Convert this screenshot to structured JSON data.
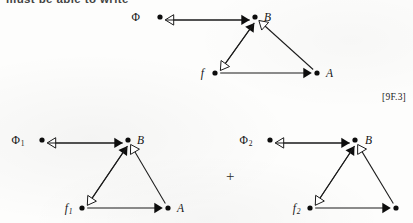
{
  "page": {
    "top_text": "must be able to write",
    "equation_tag": "[9F.3]",
    "operator": "+"
  },
  "diagrams": [
    {
      "id": "top",
      "nodes": [
        {
          "name": "phi",
          "label": "Φ",
          "sub": "",
          "italic": false
        },
        {
          "name": "b",
          "label": "B",
          "sub": "",
          "italic": true
        },
        {
          "name": "f",
          "label": "f",
          "sub": "",
          "italic": true
        },
        {
          "name": "a",
          "label": "A",
          "sub": "",
          "italic": true
        }
      ],
      "edges": [
        {
          "from": "b",
          "to": "phi",
          "head": "hollow"
        },
        {
          "from": "phi",
          "to": "b",
          "head": "solid"
        },
        {
          "from": "f",
          "to": "b",
          "head": "solid"
        },
        {
          "from": "b",
          "to": "f",
          "head": "hollow"
        },
        {
          "from": "a",
          "to": "b",
          "head": "hollow"
        },
        {
          "from": "f",
          "to": "a",
          "head": "solid"
        }
      ]
    },
    {
      "id": "bottom-left",
      "nodes": [
        {
          "name": "phi",
          "label": "Φ",
          "sub": "1",
          "italic": false
        },
        {
          "name": "b",
          "label": "B",
          "sub": "",
          "italic": true
        },
        {
          "name": "f",
          "label": "f",
          "sub": "1",
          "italic": true
        },
        {
          "name": "a",
          "label": "A",
          "sub": "",
          "italic": true
        }
      ],
      "edges": [
        {
          "from": "b",
          "to": "phi",
          "head": "hollow"
        },
        {
          "from": "phi",
          "to": "b",
          "head": "solid"
        },
        {
          "from": "f",
          "to": "b",
          "head": "solid"
        },
        {
          "from": "b",
          "to": "f",
          "head": "hollow"
        },
        {
          "from": "a",
          "to": "b",
          "head": "hollow"
        },
        {
          "from": "f",
          "to": "a",
          "head": "solid"
        }
      ]
    },
    {
      "id": "bottom-right",
      "nodes": [
        {
          "name": "phi",
          "label": "Φ",
          "sub": "2",
          "italic": false
        },
        {
          "name": "b",
          "label": "B",
          "sub": "",
          "italic": true
        },
        {
          "name": "f",
          "label": "f",
          "sub": "2",
          "italic": true
        },
        {
          "name": "a",
          "label": "",
          "sub": "",
          "italic": true
        }
      ],
      "edges": [
        {
          "from": "b",
          "to": "phi",
          "head": "hollow"
        },
        {
          "from": "phi",
          "to": "b",
          "head": "solid"
        },
        {
          "from": "f",
          "to": "b",
          "head": "solid"
        },
        {
          "from": "b",
          "to": "f",
          "head": "hollow"
        },
        {
          "from": "a",
          "to": "b",
          "head": "hollow"
        },
        {
          "from": "f",
          "to": "a",
          "head": "solid"
        }
      ]
    }
  ]
}
